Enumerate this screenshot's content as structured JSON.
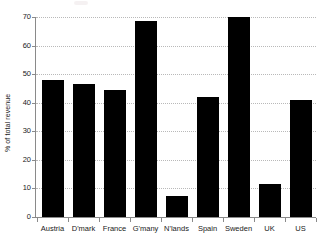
{
  "chart_data": {
    "type": "bar",
    "title": "",
    "subtitle": "",
    "xlabel": "",
    "ylabel": "% of total revenue",
    "categories": [
      "Austria",
      "D'mark",
      "France",
      "G'many",
      "N'lands",
      "Spain",
      "Sweden",
      "UK",
      "US"
    ],
    "values": [
      48,
      46.5,
      44.5,
      68.5,
      7.2,
      42,
      70,
      11.5,
      41
    ],
    "ylim": [
      0,
      70
    ],
    "ytick_labels": [
      "0",
      "10",
      "20",
      "30",
      "40",
      "50",
      "60",
      "70"
    ],
    "ytick_values": [
      0,
      10,
      20,
      30,
      40,
      50,
      60,
      70
    ],
    "grid": true,
    "grid_style": "dotted",
    "legend": "none",
    "bar_color": "#000000",
    "grid_color": "#b9b9b9",
    "axis_color": "#8a8a8a",
    "background_color": "#ffffff",
    "text_color": "#1a1a1a"
  }
}
